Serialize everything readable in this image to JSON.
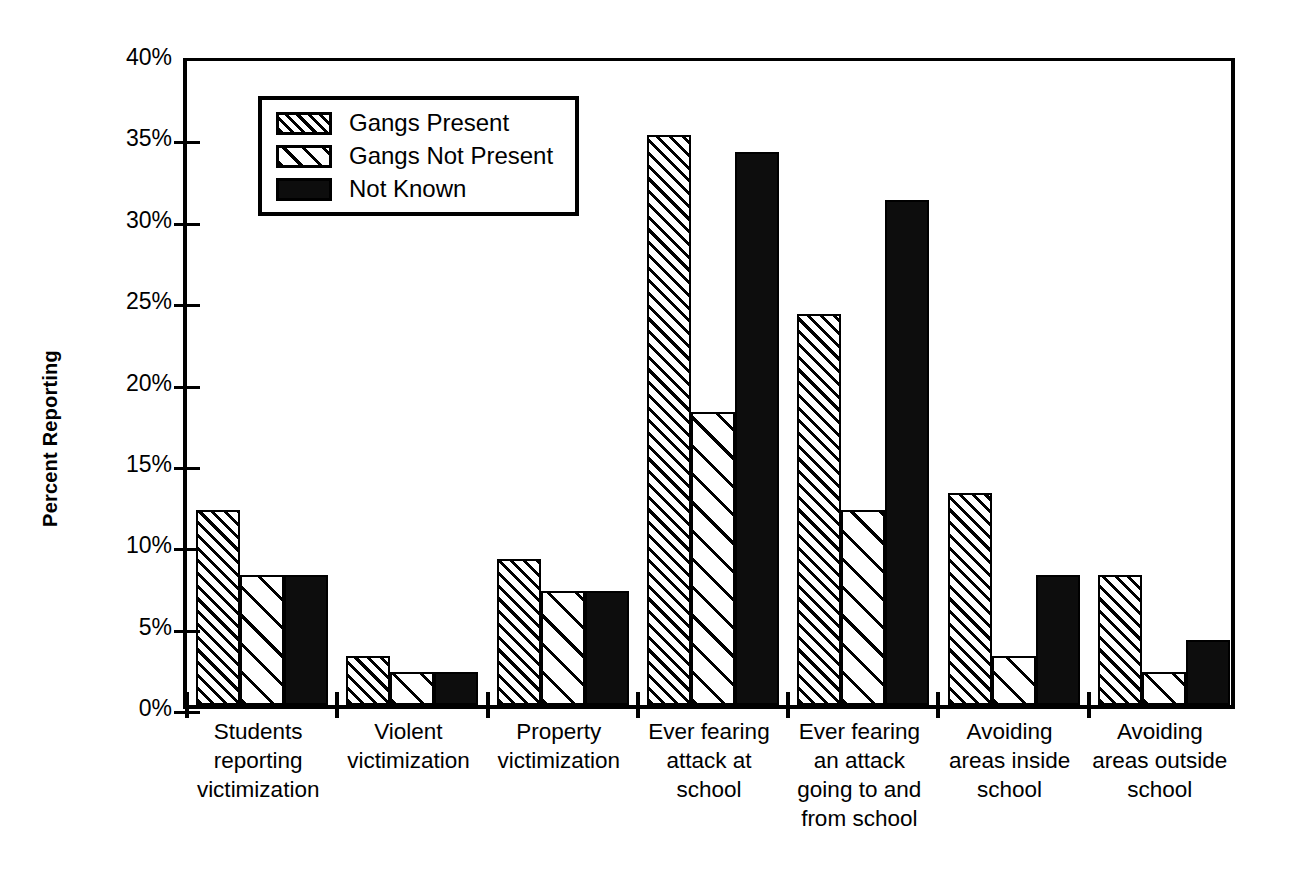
{
  "chart_data": {
    "type": "bar",
    "title": "",
    "xlabel": "",
    "ylabel": "Percent Reporting",
    "ylim": [
      0,
      40
    ],
    "ytick_labels": [
      "40%",
      "35%",
      "30%",
      "25%",
      "20%",
      "15%",
      "10%",
      "5%",
      "0%"
    ],
    "ytick_values": [
      40,
      35,
      30,
      25,
      20,
      15,
      10,
      5,
      0
    ],
    "grid": false,
    "legend_position": "upper-left-inside",
    "categories": [
      "Students\nreporting\nvictimization",
      "Violent\nvictimization",
      "Property\nvictimization",
      "Ever fearing\nattack at\nschool",
      "Ever fearing\nan attack\ngoing to and\nfrom school",
      "Avoiding\nareas inside\nschool",
      "Avoiding\nareas outside\nschool"
    ],
    "series": [
      {
        "name": "Gangs Present",
        "pattern": "dense-hatch",
        "values": [
          12,
          3,
          9,
          35,
          24,
          13,
          8
        ]
      },
      {
        "name": "Gangs Not Present",
        "pattern": "sparse-hatch",
        "values": [
          8,
          2,
          7,
          18,
          12,
          3,
          2
        ]
      },
      {
        "name": "Not Known",
        "pattern": "solid-black",
        "values": [
          8,
          2,
          7,
          34,
          31,
          8,
          4
        ]
      }
    ],
    "colors": {
      "foreground": "#000000",
      "background": "#ffffff",
      "solid_series": "#0d0d0d"
    }
  }
}
